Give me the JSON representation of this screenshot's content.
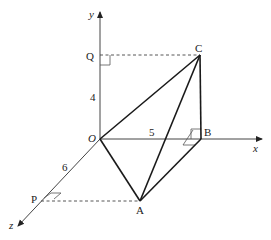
{
  "diagram": {
    "axes": {
      "x": {
        "label": "x"
      },
      "y": {
        "label": "y"
      },
      "z": {
        "label": "z"
      },
      "origin": {
        "label": "O"
      }
    },
    "points": {
      "A": {
        "label": "A"
      },
      "B": {
        "label": "B"
      },
      "C": {
        "label": "C"
      },
      "P": {
        "label": "P"
      },
      "Q": {
        "label": "Q"
      }
    },
    "dimensions": {
      "OQ": {
        "label": "4"
      },
      "OB": {
        "label": "5"
      },
      "OP": {
        "label": "6"
      }
    },
    "colors": {
      "line": "#1a1a1a",
      "axis": "#444444",
      "background": "#ffffff"
    }
  }
}
